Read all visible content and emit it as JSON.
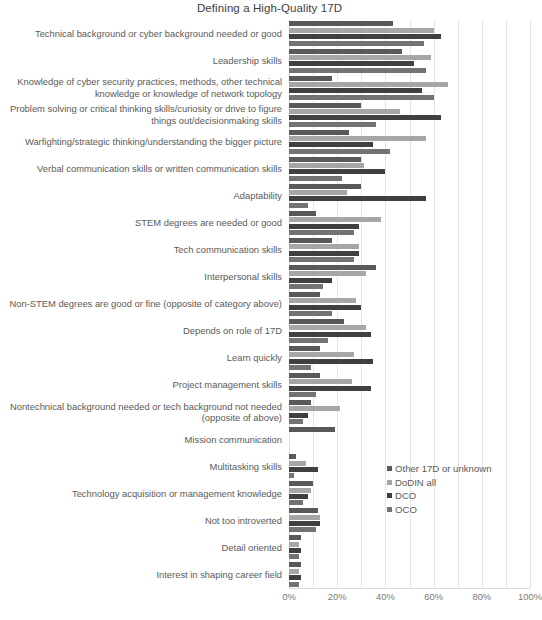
{
  "chart_data": {
    "type": "bar",
    "orientation": "horizontal",
    "grouped": true,
    "title": "Defining a High-Quality 17D",
    "xlabel": "",
    "ylabel": "",
    "xlim": [
      0,
      100
    ],
    "xunit": "%",
    "xticks": [
      "0%",
      "20%",
      "40%",
      "60%",
      "80%",
      "100%"
    ],
    "xtick_values": [
      0,
      20,
      40,
      60,
      80,
      100
    ],
    "grid": true,
    "grid_axis": "x",
    "legend_position": "center-right",
    "categories": [
      "Technical background or cyber background needed or good",
      "Leadership skills",
      "Knowledge of cyber security practices, methods, other technical knowledge or knowledge of network topology",
      "Problem solving or critical thinking skills/curiosity or drive to figure things out/decisionmaking skills",
      "Warfighting/strategic thinking/understanding the bigger picture",
      "Verbal communication skills or written communication skills",
      "Adaptability",
      "STEM degrees are needed or good",
      "Tech communication skills",
      "Interpersonal skills",
      "Non-STEM degrees are good or fine (opposite of category above)",
      "Depends on role of 17D",
      "Learn quickly",
      "Project management skills",
      "Nontechnical background needed or tech background not needed (opposite of above)",
      "Mission communication",
      "Multitasking skills",
      "Technology acquisition or management knowledge",
      "Not too introverted",
      "Detail oriented",
      "Interest in shaping career field"
    ],
    "series": [
      {
        "name": "Other 17D or unknown",
        "color": "#595959",
        "values": [
          43,
          47,
          18,
          30,
          25,
          30,
          30,
          11,
          18,
          36,
          13,
          23,
          13,
          13,
          9,
          19,
          3,
          10,
          12,
          5,
          5
        ]
      },
      {
        "name": "DoDIN all",
        "color": "#a6a6a6",
        "values": [
          60,
          59,
          66,
          46,
          57,
          31,
          24,
          38,
          29,
          32,
          28,
          32,
          27,
          26,
          21,
          0,
          7,
          9,
          13,
          4,
          4
        ]
      },
      {
        "name": "DCO",
        "color": "#404040",
        "values": [
          63,
          52,
          55,
          63,
          35,
          40,
          57,
          29,
          29,
          18,
          30,
          34,
          35,
          34,
          8,
          0,
          12,
          8,
          13,
          5,
          5
        ]
      },
      {
        "name": "OCO",
        "color": "#737373",
        "values": [
          56,
          57,
          60,
          36,
          42,
          22,
          8,
          27,
          27,
          14,
          18,
          16,
          9,
          11,
          6,
          0,
          2,
          6,
          11,
          4,
          4
        ]
      }
    ]
  },
  "legend": {
    "items": [
      {
        "label": "Other 17D or unknown",
        "color": "#595959"
      },
      {
        "label": "DoDIN all",
        "color": "#a6a6a6"
      },
      {
        "label": "DCO",
        "color": "#404040"
      },
      {
        "label": "OCO",
        "color": "#737373"
      }
    ]
  }
}
